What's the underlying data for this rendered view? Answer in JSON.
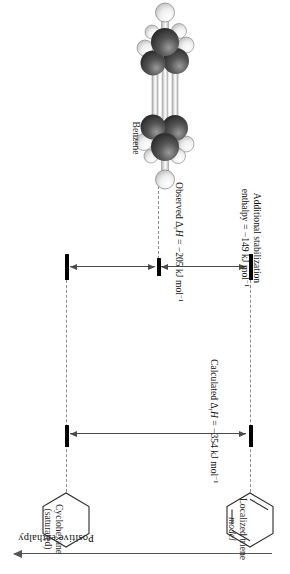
{
  "figure": {
    "type": "enthalpy-level-diagram"
  },
  "axis": {
    "label": "Positive enthalpy",
    "direction": "increasing upward",
    "arrow_icon": "arrow-up-icon"
  },
  "species": {
    "left": {
      "name_line1": "Localized triene",
      "name_line2": "model",
      "structure_icon": "cyclohexatriene-ring-icon"
    },
    "right": {
      "name_line1": "Cyclohexane",
      "name_line2": "(saturated)",
      "structure_icon": "cyclohexane-ring-icon"
    },
    "middle": {
      "name": "Benzene",
      "structure_icon": "benzene-ball-and-stick-icon"
    }
  },
  "levels": [
    {
      "id": "localized-triene-level",
      "label": "Localized triene model level"
    },
    {
      "id": "benzene-level",
      "label": "Benzene level"
    },
    {
      "id": "cyclohexane-level",
      "label": "Cyclohexane level"
    }
  ],
  "measurements": [
    {
      "id": "additional-stabilization",
      "line1": "Additional stabilization",
      "line2_prefix": "enthalpy = −149 kJ mol",
      "line2_sup": "−1",
      "value": -149,
      "unit": "kJ mol−1"
    },
    {
      "id": "observed-enthalpy",
      "prefix": "Observed Δ",
      "sub": "r",
      "mid": "H",
      "rest": " = −205 kJ mol",
      "sup": "−1",
      "value": -205,
      "unit": "kJ mol−1"
    },
    {
      "id": "calculated-enthalpy",
      "prefix": "Calculated Δ",
      "sub": "r",
      "mid": "H",
      "rest": " = −354 kJ mol",
      "sup": "−1",
      "value": -354,
      "unit": "kJ mol−1"
    }
  ],
  "colors": {
    "bar": "#000000",
    "guide": "#8d8d8d",
    "arrow": "#4a4a4a",
    "text": "#111111",
    "carbon": "#4a4a4a",
    "hydrogen": "#f2f2f2"
  }
}
